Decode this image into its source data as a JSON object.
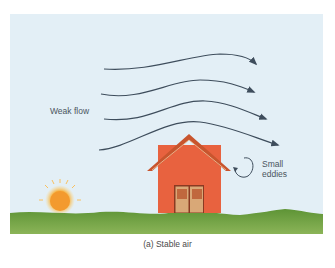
{
  "diagram": {
    "labels": {
      "weak_flow": "Weak flow",
      "small_eddies_line1": "Small",
      "small_eddies_line2": "eddies"
    },
    "caption": "(a) Stable air",
    "colors": {
      "sky": "#e3eff6",
      "ground": "#6a9a3c",
      "house_wall": "#e8623f",
      "roof": "#c8552e",
      "door": "#d9a877",
      "arrow": "#3e4d5c",
      "sun": "#f5a43a"
    }
  }
}
